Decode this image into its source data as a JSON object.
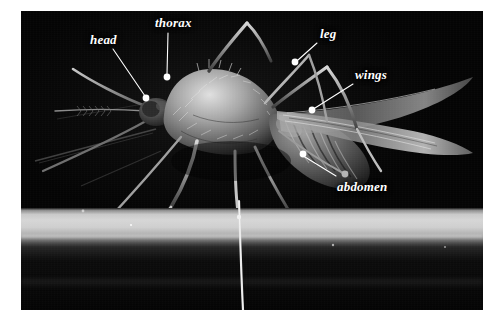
{
  "figure": {
    "kind": "annotated-photograph",
    "background_color": "#ffffff",
    "photo_background_color": "#060606",
    "label_color": "#ffffff",
    "leader_line_color": "#ffffff",
    "marker_color": "#ffffff",
    "photo": {
      "left": 21,
      "top": 11,
      "width": 462,
      "height": 299
    }
  },
  "labels": [
    {
      "id": "head",
      "text": "head",
      "text_x": 90,
      "text_y": 33,
      "line_start_x": 113,
      "line_start_y": 49,
      "line_end_x": 145,
      "line_end_y": 96,
      "dot_x": 146,
      "dot_y": 98
    },
    {
      "id": "thorax",
      "text": "thorax",
      "text_x": 155,
      "text_y": 16,
      "line_start_x": 168,
      "line_start_y": 33,
      "line_end_x": 167,
      "line_end_y": 74,
      "dot_x": 167,
      "dot_y": 77
    },
    {
      "id": "leg",
      "text": "leg",
      "text_x": 320,
      "text_y": 27,
      "line_start_x": 317,
      "line_start_y": 43,
      "line_end_x": 298,
      "line_end_y": 60,
      "dot_x": 295,
      "dot_y": 62
    },
    {
      "id": "wings",
      "text": "wings",
      "text_x": 355,
      "text_y": 68,
      "line_start_x": 353,
      "line_start_y": 84,
      "line_end_x": 315,
      "line_end_y": 108,
      "dot_x": 312,
      "dot_y": 110
    },
    {
      "id": "abdomen",
      "text": "abdomen",
      "text_x": 337,
      "text_y": 180,
      "line_start_x": 336,
      "line_start_y": 176,
      "line_end_x": 305,
      "line_end_y": 157,
      "dot_x": 303,
      "dot_y": 154
    }
  ],
  "anatomy_parts": [
    "head",
    "thorax",
    "leg",
    "wings",
    "abdomen"
  ]
}
